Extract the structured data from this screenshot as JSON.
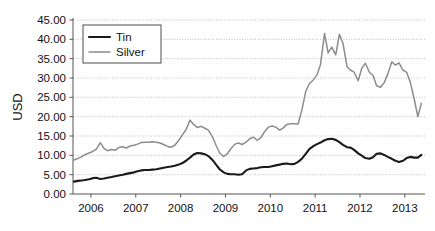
{
  "chart_data": {
    "type": "line",
    "title": "",
    "xlabel": "",
    "ylabel": "USD",
    "xlim": [
      2005.6,
      2013.45
    ],
    "ylim": [
      0,
      45
    ],
    "grid": true,
    "grid_style": "dotted-horizontal",
    "legend_position": "top-left",
    "y_ticks": [
      "0.00",
      "5.00",
      "10.00",
      "15.00",
      "20.00",
      "25.00",
      "30.00",
      "35.00",
      "40.00",
      "45.00"
    ],
    "y_tick_values": [
      0,
      5,
      10,
      15,
      20,
      25,
      30,
      35,
      40,
      45
    ],
    "x_ticks": [
      "2006",
      "2007",
      "2008",
      "2009",
      "2010",
      "2011",
      "2012",
      "2013"
    ],
    "x_tick_values": [
      2006,
      2007,
      2008,
      2009,
      2010,
      2011,
      2012,
      2013
    ],
    "series": [
      {
        "name": "Tin",
        "color": "#1a1a1a",
        "width": 2.1,
        "x": [
          2005.62,
          2005.71,
          2005.79,
          2005.87,
          2005.96,
          2006.04,
          2006.12,
          2006.21,
          2006.29,
          2006.37,
          2006.46,
          2006.54,
          2006.62,
          2006.71,
          2006.79,
          2006.87,
          2006.96,
          2007.04,
          2007.12,
          2007.21,
          2007.29,
          2007.37,
          2007.46,
          2007.54,
          2007.62,
          2007.71,
          2007.79,
          2007.87,
          2007.96,
          2008.04,
          2008.12,
          2008.21,
          2008.29,
          2008.37,
          2008.46,
          2008.54,
          2008.62,
          2008.71,
          2008.79,
          2008.87,
          2008.96,
          2009.04,
          2009.12,
          2009.21,
          2009.29,
          2009.37,
          2009.46,
          2009.54,
          2009.62,
          2009.71,
          2009.79,
          2009.87,
          2009.96,
          2010.04,
          2010.12,
          2010.21,
          2010.29,
          2010.37,
          2010.46,
          2010.54,
          2010.62,
          2010.71,
          2010.79,
          2010.87,
          2010.96,
          2011.04,
          2011.12,
          2011.21,
          2011.29,
          2011.37,
          2011.46,
          2011.54,
          2011.62,
          2011.71,
          2011.79,
          2011.87,
          2011.96,
          2012.04,
          2012.12,
          2012.21,
          2012.29,
          2012.37,
          2012.46,
          2012.54,
          2012.62,
          2012.71,
          2012.79,
          2012.87,
          2012.96,
          2013.04,
          2013.12,
          2013.21,
          2013.29,
          2013.37
        ],
        "y": [
          3.2,
          3.4,
          3.5,
          3.6,
          3.8,
          4.1,
          4.2,
          3.9,
          4.0,
          4.2,
          4.4,
          4.6,
          4.8,
          5.0,
          5.2,
          5.4,
          5.6,
          5.9,
          6.1,
          6.2,
          6.2,
          6.3,
          6.4,
          6.6,
          6.8,
          7.0,
          7.1,
          7.3,
          7.6,
          8.0,
          8.6,
          9.4,
          10.2,
          10.6,
          10.5,
          10.3,
          9.8,
          8.8,
          7.6,
          6.4,
          5.6,
          5.2,
          5.1,
          5.1,
          5.0,
          5.1,
          6.1,
          6.5,
          6.6,
          6.7,
          6.9,
          7.0,
          7.0,
          7.2,
          7.4,
          7.6,
          7.8,
          7.9,
          7.7,
          7.8,
          8.3,
          9.2,
          10.4,
          11.6,
          12.4,
          12.9,
          13.3,
          13.9,
          14.2,
          14.3,
          14.0,
          13.4,
          12.7,
          12.1,
          12.0,
          11.4,
          10.5,
          9.9,
          9.3,
          9.1,
          9.5,
          10.4,
          10.5,
          10.1,
          9.6,
          9.1,
          8.6,
          8.3,
          8.6,
          9.3,
          9.6,
          9.4,
          9.4,
          10.1
        ]
      },
      {
        "name": "Silver",
        "color": "#8c8c8c",
        "width": 1.5,
        "x": [
          2005.62,
          2005.71,
          2005.79,
          2005.87,
          2005.96,
          2006.04,
          2006.12,
          2006.21,
          2006.29,
          2006.37,
          2006.46,
          2006.54,
          2006.62,
          2006.71,
          2006.79,
          2006.87,
          2006.96,
          2007.04,
          2007.12,
          2007.21,
          2007.29,
          2007.37,
          2007.46,
          2007.54,
          2007.62,
          2007.71,
          2007.79,
          2007.87,
          2007.96,
          2008.04,
          2008.12,
          2008.21,
          2008.29,
          2008.37,
          2008.46,
          2008.54,
          2008.62,
          2008.71,
          2008.79,
          2008.87,
          2008.96,
          2009.04,
          2009.12,
          2009.21,
          2009.29,
          2009.37,
          2009.46,
          2009.54,
          2009.62,
          2009.71,
          2009.79,
          2009.87,
          2009.96,
          2010.04,
          2010.12,
          2010.21,
          2010.29,
          2010.37,
          2010.46,
          2010.54,
          2010.62,
          2010.71,
          2010.79,
          2010.87,
          2010.96,
          2011.04,
          2011.12,
          2011.21,
          2011.29,
          2011.37,
          2011.46,
          2011.54,
          2011.62,
          2011.71,
          2011.79,
          2011.87,
          2011.96,
          2012.04,
          2012.12,
          2012.21,
          2012.29,
          2012.37,
          2012.46,
          2012.54,
          2012.62,
          2012.71,
          2012.79,
          2012.87,
          2012.96,
          2013.04,
          2013.12,
          2013.21,
          2013.29,
          2013.37
        ],
        "y": [
          8.8,
          9.2,
          9.6,
          10.2,
          10.6,
          11.0,
          11.6,
          13.3,
          11.8,
          11.2,
          11.5,
          11.3,
          12.0,
          12.2,
          11.9,
          12.4,
          12.6,
          12.9,
          13.3,
          13.4,
          13.4,
          13.5,
          13.4,
          13.2,
          12.8,
          12.3,
          12.1,
          12.6,
          13.9,
          15.3,
          16.6,
          19.1,
          18.0,
          17.2,
          17.5,
          17.0,
          16.5,
          14.8,
          12.6,
          10.6,
          9.7,
          10.4,
          11.7,
          12.9,
          13.2,
          12.8,
          13.4,
          14.3,
          14.7,
          13.9,
          14.6,
          16.1,
          17.3,
          17.6,
          17.3,
          16.5,
          17.1,
          18.0,
          18.2,
          18.2,
          18.1,
          22.0,
          26.5,
          28.5,
          29.5,
          30.8,
          33.5,
          41.5,
          36.5,
          38.0,
          36.0,
          41.3,
          39.0,
          33.0,
          32.0,
          31.5,
          29.3,
          32.5,
          33.8,
          31.5,
          30.7,
          28.0,
          27.6,
          28.8,
          31.0,
          34.2,
          33.3,
          33.9,
          32.0,
          31.5,
          29.0,
          24.5,
          20.0,
          23.5
        ]
      }
    ]
  },
  "legend": {
    "items": [
      {
        "label": "Tin"
      },
      {
        "label": "Silver"
      }
    ]
  },
  "axis": {
    "y_title": "USD"
  },
  "colors": {
    "tin": "#1a1a1a",
    "silver": "#8c8c8c",
    "grid": "#b9b9b9",
    "axis": "#555555",
    "text": "#111111",
    "background": "#ffffff"
  }
}
